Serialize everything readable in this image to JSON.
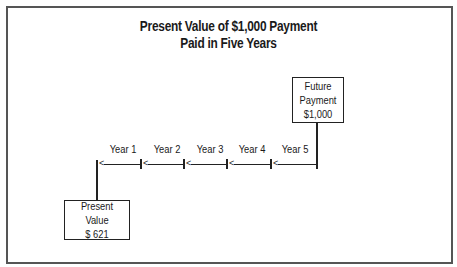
{
  "diagram": {
    "title": [
      "Present Value of $1,000 Payment",
      "Paid in Five Years"
    ],
    "future_box": {
      "lines": [
        "Future",
        "Payment",
        "$1,000"
      ]
    },
    "present_box": {
      "lines": [
        "Present Value",
        "$ 621"
      ]
    },
    "timeline": {
      "years": [
        "Year 1",
        "Year 2",
        "Year 3",
        "Year 4",
        "Year 5"
      ],
      "arrow_glyph": "<"
    }
  }
}
